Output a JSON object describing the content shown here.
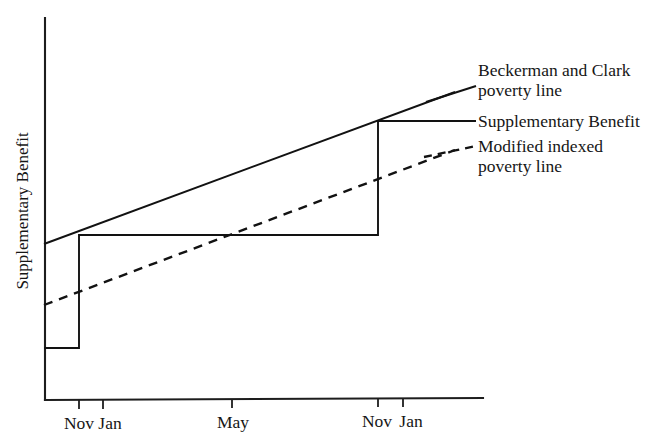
{
  "chart_data": {
    "type": "line",
    "title": "",
    "subtitle": "",
    "xlabel": "",
    "ylabel": "Supplementary Benefit",
    "grid": false,
    "legend_position": "right",
    "x_tick_labels": [
      "Nov",
      "Jan",
      "May",
      "Nov",
      "Jan"
    ],
    "x_tick_positions": [
      79,
      103,
      232,
      378,
      403
    ],
    "axis": {
      "x_start": 44,
      "x_end": 483,
      "y_top": 18,
      "y_bottom": 400
    },
    "ylim_note": "unlabelled ordinate, increasing upward",
    "series": [
      {
        "name": "Beckerman and Clark poverty line",
        "style": "solid",
        "points": [
          [
            44,
            244
          ],
          [
            455,
            92
          ]
        ]
      },
      {
        "name": "Supplementary Benefit",
        "style": "step",
        "points": [
          [
            44,
            348
          ],
          [
            79,
            348
          ],
          [
            79,
            235
          ],
          [
            378,
            235
          ],
          [
            378,
            121
          ],
          [
            455,
            121
          ]
        ]
      },
      {
        "name": "Modified indexed poverty line",
        "style": "dashed",
        "points": [
          [
            44,
            305
          ],
          [
            455,
            150
          ]
        ]
      }
    ]
  },
  "legend": {
    "entries": [
      {
        "key": "beckerman-and-clark",
        "style": "solid",
        "line1": "Beckerman and Clark",
        "line2": "poverty line"
      },
      {
        "key": "supplementary-benefit",
        "style": "solid",
        "line1": "Supplementary Benefit",
        "line2": ""
      },
      {
        "key": "modified-indexed",
        "style": "dashed",
        "line1": "Modified indexed",
        "line2": "poverty line"
      }
    ]
  },
  "colors": {
    "ink": "#121212",
    "background": "#ffffff"
  }
}
